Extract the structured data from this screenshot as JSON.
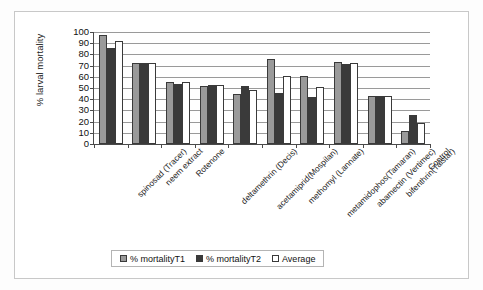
{
  "chart_data": {
    "type": "bar",
    "title": "",
    "xlabel": "",
    "ylabel": "% larval mortality",
    "ylim": [
      0,
      100
    ],
    "yticks": [
      0,
      10,
      20,
      30,
      40,
      50,
      60,
      70,
      80,
      90,
      100
    ],
    "grid": true,
    "legend_position": "bottom",
    "categories": [
      "spinosad (Tracer)",
      "neem extract",
      "Rotenone",
      "deltamethrin (Decis)",
      "acetamiprid(Mospilan)",
      "methomyl (Lannate)",
      "metamidophos(Tamaran)",
      "abamectin (Vertimec)",
      "bifenthrin(Talstar)",
      "Control"
    ],
    "series": [
      {
        "name": "% mortalityT1",
        "color": "#9a9a9a",
        "values": [
          97.5,
          72.5,
          55,
          52,
          45,
          75.5,
          60.5,
          73.5,
          42.5,
          12
        ]
      },
      {
        "name": "% mortalityT2",
        "color": "#3a3a3a",
        "values": [
          86,
          72.5,
          54,
          52.5,
          51.5,
          45.5,
          42,
          71.5,
          42.5,
          26
        ]
      },
      {
        "name": "Average",
        "color": "#ffffff",
        "values": [
          91.7,
          72.5,
          55,
          52.5,
          48,
          60.5,
          51,
          72.5,
          42.5,
          19
        ]
      }
    ]
  }
}
